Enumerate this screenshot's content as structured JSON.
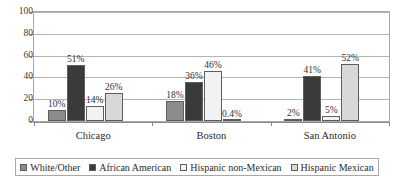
{
  "chart_data": {
    "type": "bar",
    "title": "",
    "subtitle": "",
    "xlabel": "",
    "ylabel": "",
    "ylim": [
      0,
      100
    ],
    "yticks": [
      0,
      20,
      40,
      60,
      80,
      100
    ],
    "ytick_labels": [
      "0",
      "20",
      "40",
      "60",
      "80",
      "100"
    ],
    "grid": "horizontal",
    "legend_position": "bottom",
    "categories": [
      "Chicago",
      "Boston",
      "San Antonio"
    ],
    "series": [
      {
        "name": "White/Other",
        "color": "#8c8c8c",
        "values": [
          10,
          18,
          2
        ],
        "labels": [
          "10%",
          "18%",
          "2%"
        ]
      },
      {
        "name": "African American",
        "color": "#3a3a3a",
        "values": [
          51,
          36,
          41
        ],
        "labels": [
          "51%",
          "36%",
          "41%"
        ]
      },
      {
        "name": "Hispanic non-Mexican",
        "color": "#f2f2f2",
        "values": [
          14,
          46,
          5
        ],
        "labels": [
          "14%",
          "46%",
          "5%"
        ]
      },
      {
        "name": "Hispanic Mexican",
        "color": "#d8d8d8",
        "values": [
          26,
          0.4,
          52
        ],
        "labels": [
          "26%",
          "0.4%",
          "52%"
        ]
      }
    ]
  },
  "axes": {
    "y": {
      "ticks": [
        "100",
        "80",
        "60",
        "40",
        "20",
        "0"
      ]
    },
    "x": {
      "categories": [
        "Chicago",
        "Boston",
        "San Antonio"
      ]
    }
  },
  "legend": {
    "items": [
      {
        "label": "White/Other",
        "color": "#8c8c8c"
      },
      {
        "label": "African American",
        "color": "#3a3a3a"
      },
      {
        "label": "Hispanic non-Mexican",
        "color": "#f2f2f2"
      },
      {
        "label": "Hispanic Mexican",
        "color": "#d8d8d8"
      }
    ]
  }
}
